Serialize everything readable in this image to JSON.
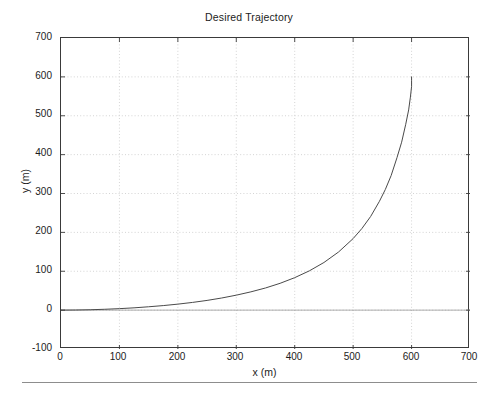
{
  "figure": {
    "title": "Desired Trajectory",
    "background_color": "#ffffff",
    "axis_color": "#3a3a3a",
    "grid_color": "#c9c9c9",
    "line_color": "#4a4a4a",
    "bottom_rule_color": "#8d8d8d"
  },
  "chart_data": {
    "type": "line",
    "title": "Desired Trajectory",
    "xlabel": "x (m)",
    "ylabel": "y (m)",
    "xlim": [
      0,
      700
    ],
    "ylim": [
      -100,
      700
    ],
    "xticks": [
      0,
      100,
      200,
      300,
      400,
      500,
      600,
      700
    ],
    "yticks": [
      -100,
      0,
      100,
      200,
      300,
      400,
      500,
      600,
      700
    ],
    "xtick_labels": [
      "0",
      "100",
      "200",
      "300",
      "400",
      "500",
      "600",
      "700"
    ],
    "ytick_labels": [
      "-100",
      "0",
      "100",
      "200",
      "300",
      "400",
      "500",
      "600",
      "700"
    ],
    "grid": true,
    "grid_style": "dotted",
    "legend": null,
    "legend_position": "none",
    "series": [
      {
        "name": "desired trajectory",
        "color": "#4a4a4a",
        "line_width": 1,
        "x": [
          0,
          25,
          50,
          75,
          100,
          125,
          150,
          175,
          200,
          225,
          250,
          275,
          300,
          325,
          350,
          375,
          400,
          425,
          450,
          475,
          500,
          515,
          530,
          545,
          555,
          565,
          575,
          583,
          590,
          595,
          598,
          600,
          600,
          600
        ],
        "y": [
          0,
          0.3,
          1.0,
          2.2,
          3.8,
          5.9,
          8.6,
          11.7,
          15.4,
          19.8,
          25.0,
          31.2,
          38.5,
          47.0,
          57.0,
          69.0,
          83.5,
          101.0,
          122.5,
          149.5,
          184.0,
          210.0,
          241.0,
          280.0,
          310.0,
          346.0,
          392.0,
          432.0,
          478.0,
          515.0,
          548.0,
          575.0,
          590.0,
          600.0
        ]
      }
    ]
  },
  "axes": {
    "ytick_positions_px": [
      37,
      76,
      114,
      153,
      192,
      231,
      270,
      309,
      348
    ],
    "xtick_positions_px": [
      60,
      118,
      177,
      235,
      294,
      352,
      411,
      469
    ]
  }
}
